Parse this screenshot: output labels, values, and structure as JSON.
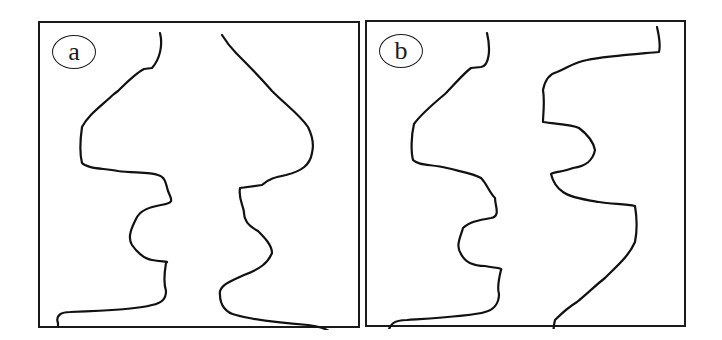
{
  "figure": {
    "panels": [
      {
        "id": "a",
        "label": "a",
        "description": "Symmetric channel outline with two mirrored wavy boundaries"
      },
      {
        "id": "b",
        "label": "b",
        "description": "Asymmetric channel outline with offset wavy boundaries"
      }
    ],
    "colors": {
      "stroke": "#111111",
      "border": "#1a1a1a",
      "background": "#ffffff"
    }
  }
}
